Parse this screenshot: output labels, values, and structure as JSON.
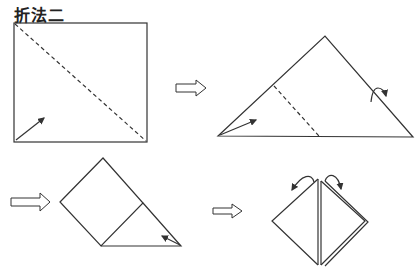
{
  "title": "折法二",
  "colors": {
    "line": "#333333",
    "background": "#ffffff"
  },
  "steps": [
    {
      "id": 1,
      "shape": "square",
      "fold": "diagonal-dashed",
      "arrow": "fold-up-from-bottom-left"
    },
    {
      "id": 2,
      "shape": "triangle",
      "fold": "dashed-crease",
      "arrow": "fold-from-left-corner",
      "turn_arrow": "flip"
    },
    {
      "id": 3,
      "shape": "folded-square-with-triangle",
      "arrow": "fold-from-right-corner"
    },
    {
      "id": 4,
      "shape": "diamond-layered",
      "arrows": "open-flaps-top"
    }
  ],
  "step_arrows": 3
}
